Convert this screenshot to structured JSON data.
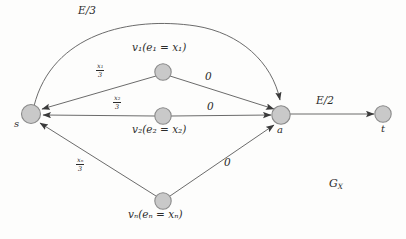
{
  "figure": {
    "name": "G_X",
    "graph_label": "G",
    "graph_label_sub": "X",
    "background_color": "#fdfdfc",
    "node_fill": "#c9c9c9",
    "node_stroke": "#8a8a8a",
    "edge_color": "#555555",
    "text_color": "#2b2b2b"
  },
  "nodes": [
    {
      "id": "s",
      "label": "s",
      "x": 31,
      "y": 114,
      "r": 9,
      "label_x": 14,
      "label_y": 122,
      "desc": null
    },
    {
      "id": "v1",
      "label": "v",
      "sub": "1",
      "x": 163,
      "y": 72,
      "r": 8,
      "desc_text": "v₁(e₁ = x₁)",
      "desc_x": 135,
      "desc_y": 48
    },
    {
      "id": "v2",
      "label": "v",
      "sub": "2",
      "x": 163,
      "y": 116,
      "r": 8,
      "desc_text": "v₂(e₂ = x₂)",
      "desc_x": 135,
      "desc_y": 129
    },
    {
      "id": "vn",
      "label": "v",
      "sub": "n",
      "x": 163,
      "y": 201,
      "r": 8,
      "desc_text": "vₙ(eₙ = xₙ)",
      "desc_x": 133,
      "desc_y": 213
    },
    {
      "id": "a",
      "label": "a",
      "x": 281,
      "y": 115,
      "r": 9,
      "label_x": 277,
      "label_y": 131,
      "desc": null
    },
    {
      "id": "t",
      "label": "t",
      "x": 383,
      "y": 114,
      "r": 8,
      "label_x": 381,
      "label_y": 130,
      "desc": null
    }
  ],
  "edges": [
    {
      "id": "s-a-arc",
      "from": "s",
      "to": "a",
      "label": "E/3",
      "label_x": 85,
      "label_y": 12,
      "shape": "arc"
    },
    {
      "id": "v1-s",
      "from": "v1",
      "to": "s",
      "label_type": "fraction",
      "num": "x₁",
      "den": "3",
      "label_x": 98,
      "label_y": 66
    },
    {
      "id": "v2-s",
      "from": "v2",
      "to": "s",
      "label_type": "fraction",
      "num": "x₂",
      "den": "3",
      "label_x": 114,
      "label_y": 98
    },
    {
      "id": "vn-s",
      "from": "vn",
      "to": "s",
      "label_type": "fraction",
      "num": "xₙ",
      "den": "3",
      "label_x": 77,
      "label_y": 160
    },
    {
      "id": "v1-a",
      "from": "v1",
      "to": "a",
      "label": "0",
      "label_x": 207,
      "label_y": 72
    },
    {
      "id": "v2-a",
      "from": "v2",
      "to": "a",
      "label": "0",
      "label_x": 209,
      "label_y": 103
    },
    {
      "id": "vn-a",
      "from": "vn",
      "to": "a",
      "label": "0",
      "label_x": 224,
      "label_y": 159
    },
    {
      "id": "a-t",
      "from": "a",
      "to": "t",
      "label": "E/2",
      "label_x": 320,
      "label_y": 100
    }
  ],
  "labels": {
    "arc_E3": "E/3",
    "edge_zero_1": "0",
    "edge_zero_2": "0",
    "edge_zero_n": "0",
    "edge_E2": "E/2",
    "node_s": "s",
    "node_a": "a",
    "node_t": "t",
    "node_v1_desc": "v₁(e₁ = x₁)",
    "node_v2_desc": "v₂(e₂ = x₂)",
    "node_vn_desc": "vₙ(eₙ = xₙ)",
    "graph_name": "G",
    "graph_name_sub": "X",
    "frac_x1_num": "x₁",
    "frac_x2_num": "x₂",
    "frac_xn_num": "xₙ",
    "frac_den": "3"
  }
}
